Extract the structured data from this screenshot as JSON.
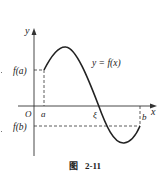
{
  "figure": {
    "caption_prefix": "图",
    "caption_number": "2-11",
    "labels": {
      "y_axis": "y",
      "x_axis": "x",
      "origin": "O",
      "a": "a",
      "b": "b",
      "xi": "ξ",
      "fa": "f(a)",
      "fb": "f(b)",
      "curve": "y = f(x)"
    },
    "colors": {
      "stroke": "#222222",
      "background": "#ffffff"
    }
  }
}
